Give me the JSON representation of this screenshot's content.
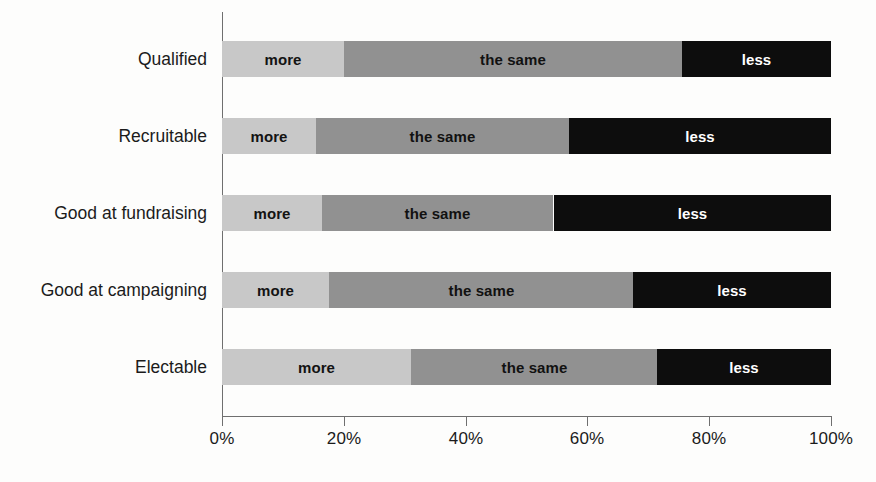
{
  "chart_data": {
    "type": "bar",
    "orientation": "horizontal",
    "stacked": true,
    "normalized_percent": true,
    "title": "",
    "subtitle": "",
    "xlabel": "",
    "ylabel": "",
    "xlim": [
      0,
      100
    ],
    "xticks": [
      0,
      20,
      40,
      60,
      80,
      100
    ],
    "xtick_labels": [
      "0%",
      "20%",
      "40%",
      "60%",
      "80%",
      "100%"
    ],
    "grid": false,
    "legend": "none (segments labeled in place)",
    "categories": [
      "Qualified",
      "Recruitable",
      "Good at fundraising",
      "Good at campaigning",
      "Electable"
    ],
    "series": [
      {
        "name": "more",
        "color": "#c8c8c8",
        "values": [
          20.0,
          15.5,
          16.5,
          17.5,
          31.0
        ]
      },
      {
        "name": "the same",
        "color": "#919191",
        "values": [
          55.5,
          41.5,
          38.0,
          50.0,
          40.5
        ]
      },
      {
        "name": "less",
        "color": "#0d0d0d",
        "values": [
          24.5,
          43.0,
          45.5,
          32.5,
          28.5
        ]
      }
    ],
    "segment_labels": {
      "more": "more",
      "same": "the same",
      "less": "less"
    }
  },
  "rows": [
    {
      "label": "Qualified",
      "segments": [
        {
          "key": "more",
          "label": "more",
          "start": 0.0,
          "end": 20.0
        },
        {
          "key": "same",
          "label": "the same",
          "start": 20.0,
          "end": 75.5
        },
        {
          "key": "less",
          "label": "less",
          "start": 75.5,
          "end": 100.0
        }
      ]
    },
    {
      "label": "Recruitable",
      "segments": [
        {
          "key": "more",
          "label": "more",
          "start": 0.0,
          "end": 15.5
        },
        {
          "key": "same",
          "label": "the same",
          "start": 15.5,
          "end": 57.0
        },
        {
          "key": "less",
          "label": "less",
          "start": 57.0,
          "end": 100.0
        }
      ]
    },
    {
      "label": "Good at fundraising",
      "segments": [
        {
          "key": "more",
          "label": "more",
          "start": 0.0,
          "end": 16.5
        },
        {
          "key": "same",
          "label": "the same",
          "start": 16.5,
          "end": 54.5
        },
        {
          "key": "less",
          "label": "less",
          "start": 54.5,
          "end": 100.0
        }
      ]
    },
    {
      "label": "Good at campaigning",
      "segments": [
        {
          "key": "more",
          "label": "more",
          "start": 0.0,
          "end": 17.5
        },
        {
          "key": "same",
          "label": "the same",
          "start": 17.5,
          "end": 67.5
        },
        {
          "key": "less",
          "label": "less",
          "start": 67.5,
          "end": 100.0
        }
      ]
    },
    {
      "label": "Electable",
      "segments": [
        {
          "key": "more",
          "label": "more",
          "start": 0.0,
          "end": 31.0
        },
        {
          "key": "same",
          "label": "the same",
          "start": 31.0,
          "end": 71.5
        },
        {
          "key": "less",
          "label": "less",
          "start": 71.5,
          "end": 100.0
        }
      ]
    }
  ],
  "axis": {
    "ticks": [
      {
        "value": 0,
        "label": "0%"
      },
      {
        "value": 20,
        "label": "20%"
      },
      {
        "value": 40,
        "label": "40%"
      },
      {
        "value": 60,
        "label": "60%"
      },
      {
        "value": 80,
        "label": "80%"
      },
      {
        "value": 100,
        "label": "100%"
      }
    ]
  },
  "colors": {
    "more": "#c8c8c8",
    "same": "#919191",
    "less": "#0d0d0d",
    "axis": "#6f6f6f",
    "text": "#1b1b1b",
    "background": "#fdfdfc"
  }
}
